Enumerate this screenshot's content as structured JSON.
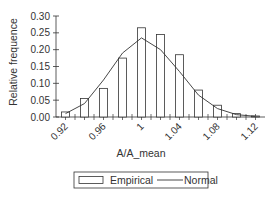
{
  "chart_data": {
    "type": "bar",
    "title": "",
    "xlabel": "A/A_mean",
    "ylabel": "Relative frequence",
    "ylim": [
      0,
      0.3
    ],
    "xlim": [
      0.91,
      1.13
    ],
    "yticks": [
      "0.00",
      "0.05",
      "0.10",
      "0.15",
      "0.20",
      "0.25",
      "0.30"
    ],
    "xticks": [
      "0.92",
      "0.96",
      "1",
      "1.04",
      "1.08",
      "1.12"
    ],
    "grid": false,
    "legend_position": "bottom",
    "categories": [
      0.92,
      0.94,
      0.96,
      0.98,
      1.0,
      1.02,
      1.04,
      1.06,
      1.08,
      1.1,
      1.12
    ],
    "series": [
      {
        "name": "Empirical",
        "type": "bar",
        "values": [
          0.015,
          0.055,
          0.085,
          0.175,
          0.265,
          0.245,
          0.185,
          0.08,
          0.035,
          0.01,
          0.003
        ]
      },
      {
        "name": "Normal",
        "type": "line",
        "values": [
          0.01,
          0.04,
          0.11,
          0.19,
          0.235,
          0.2,
          0.135,
          0.065,
          0.025,
          0.007,
          0.002
        ]
      }
    ]
  },
  "legend": {
    "empirical_label": "Empirical",
    "normal_label": "Normal"
  }
}
